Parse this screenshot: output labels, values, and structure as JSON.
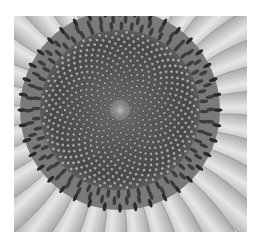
{
  "image": {
    "subject": "sunflower head close-up",
    "style": "grayscale photograph",
    "background_color": "#ffffff",
    "frame": {
      "x": 14,
      "y": 16,
      "width": 233,
      "height": 216
    },
    "center": {
      "x": 120,
      "y": 110
    },
    "colors": {
      "petal_light": "#e2e2e2",
      "petal_mid": "#b8b8b8",
      "ring_dark": "#3a3a3a",
      "seed_light": "#9a9a9a",
      "seed_dark": "#2e2e2e"
    }
  }
}
